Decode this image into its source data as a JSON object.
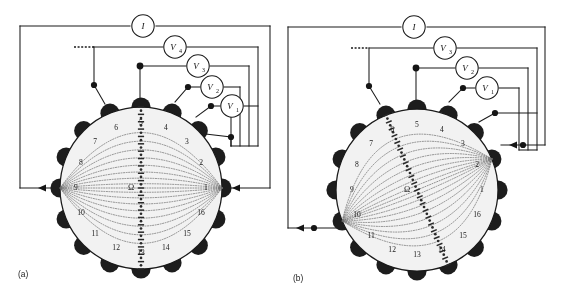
{
  "figure": {
    "type": "eit-adjacent-drive-circuit-diagram",
    "panel_count": 2
  },
  "panels": [
    {
      "id": "a",
      "caption": "(a)",
      "ammeter": {
        "label": "I"
      },
      "voltmeters": [
        {
          "label": "V",
          "sub": "4"
        },
        {
          "label": "V",
          "sub": "3"
        },
        {
          "label": "V",
          "sub": "2"
        },
        {
          "label": "V",
          "sub": "1"
        }
      ],
      "continuation_marker": "dashed",
      "center_label": "Ω",
      "electrode_labels": [
        "1",
        "2",
        "3",
        "4",
        "5",
        "6",
        "7",
        "8",
        "9",
        "10",
        "11",
        "12",
        "13",
        "14",
        "15",
        "16"
      ],
      "current_source_electrode": "1",
      "current_sink_electrode": "9",
      "equipotential_orientation": "vertical",
      "equipotential_from_electrode": "5",
      "equipotential_to_electrode": "13"
    },
    {
      "id": "b",
      "caption": "(b)",
      "ammeter": {
        "label": "I"
      },
      "voltmeters": [
        {
          "label": "V",
          "sub": "3"
        },
        {
          "label": "V",
          "sub": "2"
        },
        {
          "label": "V",
          "sub": "1"
        }
      ],
      "continuation_marker": "dashed",
      "center_label": "Ω",
      "electrode_labels": [
        "1",
        "2",
        "3",
        "4",
        "5",
        "6",
        "7",
        "8",
        "9",
        "10",
        "11",
        "12",
        "13",
        "14",
        "15",
        "16"
      ],
      "current_source_electrode": "2",
      "current_sink_electrode": "10",
      "equipotential_orientation": "diagonal",
      "equipotential_from_electrode": "6",
      "equipotential_to_electrode": "14"
    }
  ],
  "colors": {
    "ink": "#1a1a1a",
    "electrode": "#1d1d1d",
    "tank": "#f2f2ef",
    "flowline": "#6d6d6d",
    "background": "#ffffff"
  }
}
